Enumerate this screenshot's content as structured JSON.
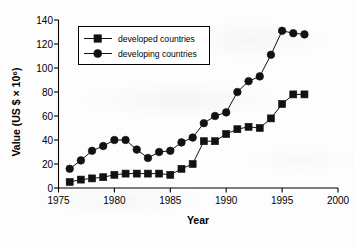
{
  "chart_data": {
    "type": "line",
    "title": "",
    "xlabel": "Year",
    "ylabel": "Value (US $ × 10⁶)",
    "xlim": [
      1975,
      2000
    ],
    "ylim": [
      0,
      140
    ],
    "xticks": [
      1975,
      1980,
      1985,
      1990,
      1995,
      2000
    ],
    "yticks": [
      0,
      20,
      40,
      60,
      80,
      100,
      120,
      140
    ],
    "grid": false,
    "legend_position": "upper-left-inside",
    "x": [
      1976,
      1977,
      1978,
      1979,
      1980,
      1981,
      1982,
      1983,
      1984,
      1985,
      1986,
      1987,
      1988,
      1989,
      1990,
      1991,
      1992,
      1993,
      1994,
      1995,
      1996,
      1997
    ],
    "series": [
      {
        "name": "developed countries",
        "marker": "square",
        "values": [
          5,
          7,
          8,
          9,
          11,
          12,
          12,
          12,
          12,
          11,
          16,
          20,
          39,
          39,
          45,
          49,
          51,
          50,
          58,
          70,
          78,
          78
        ]
      },
      {
        "name": "developing countries",
        "marker": "circle",
        "values": [
          16,
          23,
          31,
          35,
          40,
          40,
          32,
          25,
          30,
          31,
          38,
          42,
          54,
          60,
          63,
          80,
          89,
          93,
          111,
          131,
          129,
          128
        ]
      }
    ]
  },
  "axes": {
    "x_title": "Year",
    "y_title": "Value (US $ × 10⁶)",
    "x_tick_labels": [
      "1975",
      "1980",
      "1985",
      "1990",
      "1995",
      "2000"
    ],
    "y_tick_labels": [
      "0",
      "20",
      "40",
      "60",
      "80",
      "100",
      "120",
      "140"
    ]
  },
  "legend": {
    "items": [
      {
        "label": "developed countries",
        "marker": "square"
      },
      {
        "label": "developing countries",
        "marker": "circle"
      }
    ]
  }
}
